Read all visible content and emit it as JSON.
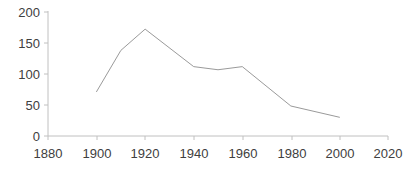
{
  "chart_data": {
    "type": "line",
    "title": "",
    "subtitle": "",
    "xlabel": "",
    "ylabel": "",
    "xlim": [
      1880,
      2020
    ],
    "ylim": [
      0,
      200
    ],
    "grid": false,
    "legend": null,
    "x_ticks": [
      1880,
      1900,
      1920,
      1940,
      1960,
      1980,
      2000,
      2020
    ],
    "x_tick_labels": [
      "1880",
      "1900",
      "1920",
      "1940",
      "1960",
      "1980",
      "2000",
      "2020"
    ],
    "y_ticks": [
      0,
      50,
      100,
      150,
      200
    ],
    "y_tick_labels": [
      "0",
      "50",
      "100",
      "150",
      "200"
    ],
    "series": [
      {
        "name": "series-1",
        "color": "#9a9a9a",
        "x": [
          1900,
          1910,
          1920,
          1940,
          1950,
          1960,
          1980,
          2000
        ],
        "values": [
          71,
          137,
          171,
          111,
          106,
          111,
          48,
          30
        ]
      }
    ]
  },
  "style": {
    "background": "#ffffff",
    "axis_color": "#c0c0c0",
    "tick_text_color": "#404040",
    "line_color": "#9a9a9a"
  }
}
